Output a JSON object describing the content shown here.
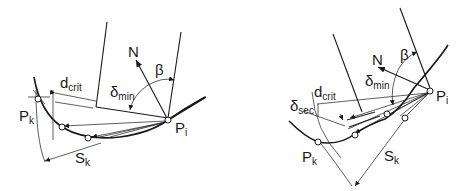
{
  "figure": {
    "left_panel": {
      "labels": {
        "N": "N",
        "beta": "β",
        "delta_min_main": "δ",
        "delta_min_sub": "min",
        "d_crit_main": "d",
        "d_crit_sub": "crit",
        "P_k_main": "P",
        "P_k_sub": "k",
        "P_i_main": "P",
        "P_i_sub": "i",
        "S_k_main": "S",
        "S_k_sub": "k"
      }
    },
    "right_panel": {
      "labels": {
        "N": "N",
        "beta": "β",
        "delta_min_main": "δ",
        "delta_min_sub": "min",
        "delta_sec_main": "δ",
        "delta_sec_sub": "sec",
        "d_crit_main": "d",
        "d_crit_sub": "crit",
        "P_k_main": "P",
        "P_k_sub": "k",
        "P_i_main": "P",
        "P_i_sub": "i",
        "S_k_main": "S",
        "S_k_sub": "k"
      }
    },
    "colors": {
      "ink": "#1a1a1a",
      "background": "#ffffff"
    }
  }
}
